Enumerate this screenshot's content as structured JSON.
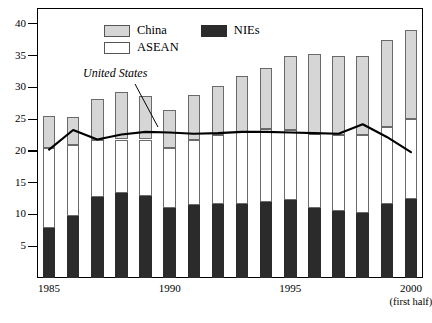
{
  "chart_data": {
    "type": "bar",
    "subtype": "stacked-bar-with-overlay-line",
    "title": "",
    "xlabel": "",
    "ylabel": "",
    "ylim": [
      0,
      42.5
    ],
    "yticks": [
      5,
      10,
      15,
      20,
      25,
      30,
      35,
      40
    ],
    "grid": false,
    "legend_position": "top-center",
    "categories": [
      "1985",
      "1986",
      "1987",
      "1988",
      "1989",
      "1990",
      "1991",
      "1992",
      "1993",
      "1994",
      "1995",
      "1996",
      "1997",
      "1998",
      "1999",
      "2000"
    ],
    "xtick_labels": [
      "1985",
      "1990",
      "1995",
      "2000"
    ],
    "xtick_sublabel": "(first half)",
    "series": [
      {
        "name": "NIEs",
        "color": "#2b2b2b",
        "stack": "bottom",
        "values": [
          7.8,
          9.8,
          12.7,
          13.4,
          12.9,
          11.0,
          11.5,
          11.6,
          11.7,
          11.9,
          12.3,
          11.0,
          10.6,
          10.3,
          11.7,
          12.4
        ]
      },
      {
        "name": "ASEAN",
        "color": "#ffffff",
        "stack": "middle",
        "values": [
          12.7,
          11.2,
          9.1,
          8.4,
          8.9,
          9.4,
          10.2,
          10.9,
          11.3,
          11.6,
          11.0,
          11.6,
          11.9,
          12.2,
          12.0,
          12.6
        ]
      },
      {
        "name": "China",
        "color": "#d6d6d6",
        "stack": "top",
        "values": [
          5.0,
          4.3,
          6.4,
          7.5,
          6.8,
          6.1,
          7.1,
          7.7,
          8.8,
          9.5,
          11.7,
          12.6,
          12.5,
          12.5,
          13.7,
          14.0
        ]
      }
    ],
    "totals": [
      25.5,
      25.3,
      28.2,
      29.3,
      28.6,
      26.5,
      28.8,
      30.2,
      31.8,
      33.0,
      35.0,
      35.2,
      35.0,
      35.0,
      37.4,
      39.0
    ],
    "overlay_line": {
      "name": "United States",
      "color": "#000000",
      "label_style": "italic",
      "values": [
        20.2,
        23.3,
        21.8,
        22.6,
        23.0,
        22.9,
        22.7,
        22.8,
        23.0,
        23.0,
        22.9,
        22.8,
        22.7,
        24.2,
        22.2,
        19.8
      ]
    }
  },
  "legend": {
    "china_label": "China",
    "asean_label": "ASEAN",
    "nies_label": "NIEs"
  },
  "annotations": {
    "united_states": "United States"
  },
  "colors": {
    "china": "#d6d6d6",
    "asean": "#ffffff",
    "nies": "#2b2b2b",
    "us_line": "#000000",
    "frame": "#000000"
  }
}
